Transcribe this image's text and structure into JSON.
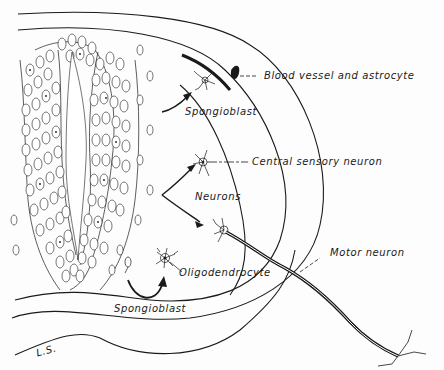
{
  "figure": {
    "kind": "schematic diagram of developing neural tube cell lineages",
    "colors": {
      "ink": "#1a1a1a",
      "paper": "#fdfdfd"
    }
  },
  "labels": {
    "blood_vessel": "Blood vessel and astrocyte",
    "spongioblast_top": "Spongioblast",
    "central_sensory": "Central sensory neuron",
    "neurons": "Neurons",
    "motor_neuron": "Motor neuron",
    "oligodendrocyte": "Oligodendrocyte",
    "spongioblast_bottom": "Spongioblast",
    "section": "L.S."
  }
}
